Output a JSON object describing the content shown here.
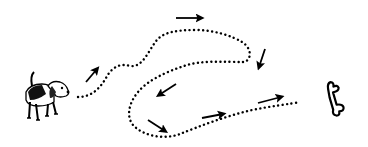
{
  "illustration": {
    "description": "dog-following-dotted-trail-to-bone",
    "width": 368,
    "height": 147,
    "background": "#ffffff",
    "ink_color": "#000000",
    "start_icon": "dog-icon",
    "end_icon": "bone-icon",
    "trail_style": "dotted",
    "trail_points": [
      [
        78,
        97
      ],
      [
        92,
        95
      ],
      [
        100,
        88
      ],
      [
        106,
        78
      ],
      [
        110,
        70
      ],
      [
        118,
        64
      ],
      [
        128,
        66
      ],
      [
        138,
        64
      ],
      [
        146,
        56
      ],
      [
        154,
        44
      ],
      [
        162,
        34
      ],
      [
        176,
        30
      ],
      [
        196,
        30
      ],
      [
        214,
        32
      ],
      [
        230,
        38
      ],
      [
        242,
        42
      ],
      [
        248,
        50
      ],
      [
        250,
        60
      ],
      [
        244,
        62
      ],
      [
        226,
        62
      ],
      [
        204,
        62
      ],
      [
        188,
        66
      ],
      [
        170,
        74
      ],
      [
        154,
        80
      ],
      [
        140,
        90
      ],
      [
        132,
        100
      ],
      [
        128,
        112
      ],
      [
        132,
        124
      ],
      [
        144,
        134
      ],
      [
        160,
        138
      ],
      [
        176,
        136
      ],
      [
        192,
        130
      ],
      [
        212,
        124
      ],
      [
        232,
        116
      ],
      [
        252,
        110
      ],
      [
        272,
        106
      ],
      [
        290,
        104
      ],
      [
        300,
        102
      ]
    ],
    "arrows": [
      {
        "name": "arrow-up-right",
        "from": [
          86,
          82
        ],
        "to": [
          98,
          68
        ]
      },
      {
        "name": "arrow-right-top",
        "from": [
          176,
          18
        ],
        "to": [
          202,
          18
        ]
      },
      {
        "name": "arrow-down",
        "from": [
          264,
          50
        ],
        "to": [
          258,
          68
        ]
      },
      {
        "name": "arrow-down-left",
        "from": [
          176,
          84
        ],
        "to": [
          158,
          95
        ]
      },
      {
        "name": "arrow-down-right",
        "from": [
          148,
          120
        ],
        "to": [
          166,
          132
        ]
      },
      {
        "name": "arrow-right-low",
        "from": [
          202,
          118
        ],
        "to": [
          224,
          114
        ]
      },
      {
        "name": "arrow-right-end",
        "from": [
          258,
          103
        ],
        "to": [
          282,
          97
        ]
      }
    ]
  }
}
